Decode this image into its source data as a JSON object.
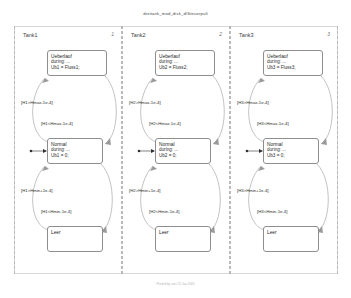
{
  "document": {
    "title": "dreitank_mod_disk_d/Steuerpult",
    "footer": "Printed by user 22-Jun-2005"
  },
  "subcharts": [
    {
      "label": "Tank1",
      "order": "1",
      "states": [
        {
          "name": "Ueberlauf",
          "lines": [
            "during: ...",
            "Ub1 = Fluss1;"
          ]
        },
        {
          "name": "Normal",
          "lines": [
            "during: ...",
            "Ub1 = 0;"
          ],
          "has_default_transition": true
        },
        {
          "name": "Leer",
          "lines": []
        }
      ],
      "transitions": [
        {
          "guard": "[H1>Hmax-1e-4]",
          "direction": "up"
        },
        {
          "guard": "[H1<Hmax-1e-4]",
          "direction": "down"
        },
        {
          "guard": "[H1>Hmin+1e-4]",
          "direction": "up"
        },
        {
          "guard": "[H1<Hmin-1e-4]",
          "direction": "down"
        }
      ]
    },
    {
      "label": "Tank2",
      "order": "2",
      "states": [
        {
          "name": "Ueberlauf",
          "lines": [
            "during: ...",
            "Ub2 = Fluss2;"
          ]
        },
        {
          "name": "Normal",
          "lines": [
            "during: ...",
            "Ub2 = 0;"
          ],
          "has_default_transition": true
        },
        {
          "name": "Leer",
          "lines": []
        }
      ],
      "transitions": [
        {
          "guard": "[H2>Hmax-1e-4]",
          "direction": "up"
        },
        {
          "guard": "[H2<Hmax-1e-4]",
          "direction": "down"
        },
        {
          "guard": "[H2>Hmin+1e-4]",
          "direction": "up"
        },
        {
          "guard": "[H2<Hmin-1e-4]",
          "direction": "down"
        }
      ]
    },
    {
      "label": "Tank3",
      "order": "3",
      "states": [
        {
          "name": "Ueberlauf",
          "lines": [
            "during: ...",
            "Ub3 = Fluss3;"
          ]
        },
        {
          "name": "Normal",
          "lines": [
            "during: ...",
            "Ub3 = 0;"
          ],
          "has_default_transition": true
        },
        {
          "name": "Leer",
          "lines": []
        }
      ],
      "transitions": [
        {
          "guard": "[H3>Hmax-1e-4]",
          "direction": "up"
        },
        {
          "guard": "[H3<Hmax-1e-4]",
          "direction": "down"
        },
        {
          "guard": "[H3>Hmin+1e-4]",
          "direction": "up"
        },
        {
          "guard": "[H3<Hmin-1e-4]",
          "direction": "down"
        }
      ]
    }
  ],
  "colors": {
    "state_border": "#8e8e8e",
    "transition": "#9a9a9a",
    "separator": "#b9b9b9",
    "text": "#2e2e2e"
  }
}
